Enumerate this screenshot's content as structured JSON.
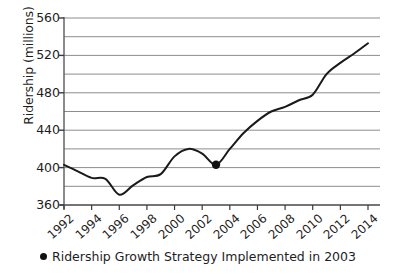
{
  "chart_data": {
    "type": "line",
    "title": "",
    "xlabel": "",
    "ylabel": "Ridership (millions)",
    "xlim": [
      1992,
      2014
    ],
    "ylim": [
      360,
      560
    ],
    "y_major_ticks": [
      360,
      400,
      440,
      480,
      520,
      560
    ],
    "y_minor_gridlines": [
      380,
      420,
      460,
      500,
      540
    ],
    "x_ticks": [
      1992,
      1994,
      1996,
      1998,
      2000,
      2002,
      2004,
      2006,
      2008,
      2010,
      2012,
      2014
    ],
    "x_tick_labels": [
      "1992",
      "1994",
      "1996",
      "1998",
      "2000",
      "2002",
      "2004",
      "2006",
      "2008",
      "2010",
      "2012",
      "2014"
    ],
    "y_tick_labels": [
      "360",
      "400",
      "440",
      "480",
      "520",
      "560"
    ],
    "grid": "horizontal",
    "legend_position": "below",
    "line_color": "#1a1a1a",
    "marker_color": "#111111",
    "series": [
      {
        "name": "Ridership",
        "x": [
          1992,
          1993,
          1994,
          1995,
          1996,
          1997,
          1998,
          1999,
          2000,
          2001,
          2002,
          2003,
          2004,
          2005,
          2006,
          2007,
          2008,
          2009,
          2010,
          2011,
          2012,
          2013,
          2014
        ],
        "values": [
          403,
          396,
          389,
          388,
          371,
          381,
          390,
          393,
          412,
          420,
          415,
          403,
          420,
          437,
          450,
          460,
          465,
          472,
          478,
          500,
          512,
          522,
          533
        ]
      }
    ],
    "annotations": [
      {
        "label": "Ridership Growth Strategy Implemented in 2003",
        "x": 2003,
        "y": 403,
        "marker": "circle"
      }
    ],
    "legend": [
      {
        "marker": "circle",
        "label": "Ridership Growth Strategy Implemented in 2003"
      }
    ]
  }
}
